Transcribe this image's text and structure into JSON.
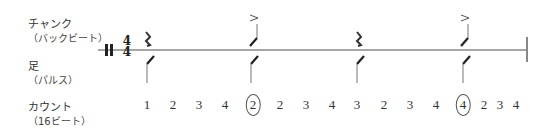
{
  "labels": {
    "chunk": {
      "title": "チャンク",
      "sub": "（バックビート）"
    },
    "foot": {
      "title": "足",
      "sub": "（パルス）"
    },
    "count": {
      "title": "カウント",
      "sub": "（16ビート）"
    }
  },
  "time_signature": {
    "top": "4",
    "bottom": "4"
  },
  "beats": [
    {
      "beat": 1,
      "chunk": "rest",
      "foot": "slash",
      "accent": false
    },
    {
      "beat": 2,
      "chunk": "slash",
      "foot": "slash",
      "accent": true
    },
    {
      "beat": 3,
      "chunk": "rest",
      "foot": "slash",
      "accent": false
    },
    {
      "beat": 4,
      "chunk": "slash",
      "foot": "slash",
      "accent": true
    }
  ],
  "accent_mark": ">",
  "counts": [
    {
      "text": "1",
      "circled": false
    },
    {
      "text": "2",
      "circled": false
    },
    {
      "text": "3",
      "circled": false
    },
    {
      "text": "4",
      "circled": false
    },
    {
      "text": "2",
      "circled": true
    },
    {
      "text": "2",
      "circled": false
    },
    {
      "text": "3",
      "circled": false
    },
    {
      "text": "4",
      "circled": false
    },
    {
      "text": "3",
      "circled": false
    },
    {
      "text": "2",
      "circled": false
    },
    {
      "text": "3",
      "circled": false
    },
    {
      "text": "4",
      "circled": false
    },
    {
      "text": "4",
      "circled": true
    },
    {
      "text": "2",
      "circled": false
    },
    {
      "text": "3",
      "circled": false
    },
    {
      "text": "4",
      "circled": false
    }
  ]
}
